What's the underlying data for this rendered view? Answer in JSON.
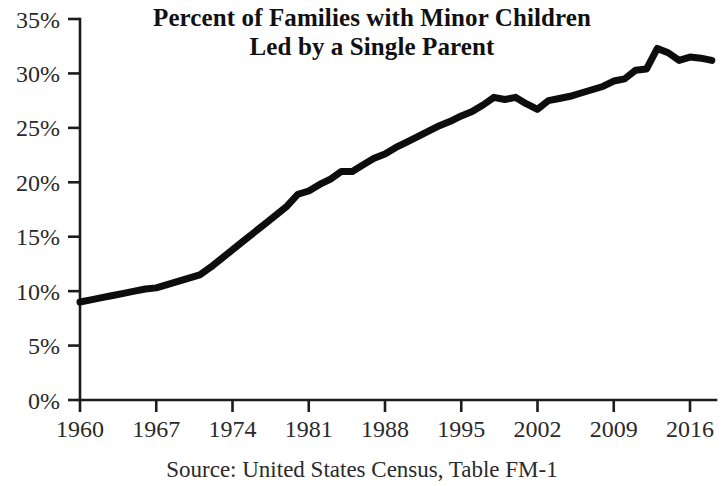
{
  "chart_data": {
    "type": "line",
    "title": "Percent of Families with Minor Children Led by a Single Parent",
    "title_lines": [
      "Percent of Families with Minor Children",
      "Led by a Single Parent"
    ],
    "source_note": "Source: United States Census, Table FM-1",
    "xlabel": "",
    "ylabel": "",
    "xlim": [
      1960,
      2018
    ],
    "ylim": [
      0,
      35
    ],
    "grid": false,
    "legend": false,
    "legend_position": "none",
    "line_color": "#0d0d0d",
    "axis_color": "#1c1c1c",
    "background_color": "#ffffff",
    "y_ticks": [
      0,
      5,
      10,
      15,
      20,
      25,
      30,
      35
    ],
    "y_tick_labels": [
      "0%",
      "5%",
      "10%",
      "15%",
      "20%",
      "25%",
      "30%",
      "35%"
    ],
    "x_ticks": [
      1960,
      1967,
      1974,
      1981,
      1988,
      1995,
      2002,
      2009,
      2016
    ],
    "x_tick_labels": [
      "1960",
      "1967",
      "1974",
      "1981",
      "1988",
      "1995",
      "2002",
      "2009",
      "2016"
    ],
    "series": [
      {
        "name": "Percent of families with minor children led by a single parent",
        "x": [
          1960,
          1961,
          1962,
          1963,
          1964,
          1965,
          1966,
          1967,
          1968,
          1969,
          1970,
          1971,
          1972,
          1973,
          1974,
          1975,
          1976,
          1977,
          1978,
          1979,
          1980,
          1981,
          1982,
          1983,
          1984,
          1985,
          1986,
          1987,
          1988,
          1989,
          1990,
          1991,
          1992,
          1993,
          1994,
          1995,
          1996,
          1997,
          1998,
          1999,
          2000,
          2001,
          2002,
          2003,
          2004,
          2005,
          2006,
          2007,
          2008,
          2009,
          2010,
          2011,
          2012,
          2013,
          2014,
          2015,
          2016,
          2017,
          2018
        ],
        "values": [
          9.0,
          9.2,
          9.4,
          9.6,
          9.8,
          10.0,
          10.2,
          10.3,
          10.6,
          10.9,
          11.2,
          11.5,
          12.2,
          13.0,
          13.8,
          14.6,
          15.4,
          16.2,
          17.0,
          17.8,
          18.9,
          19.2,
          19.8,
          20.3,
          21.0,
          21.0,
          21.6,
          22.2,
          22.6,
          23.2,
          23.7,
          24.2,
          24.7,
          25.2,
          25.6,
          26.1,
          26.5,
          27.1,
          27.8,
          27.6,
          27.8,
          27.2,
          26.7,
          27.5,
          27.7,
          27.9,
          28.2,
          28.5,
          28.8,
          29.3,
          29.5,
          30.3,
          30.4,
          32.3,
          31.9,
          31.2,
          31.5,
          31.4,
          31.2
        ]
      }
    ],
    "notable_points": {
      "start": {
        "year": 1960,
        "value": 9.0
      },
      "peak": {
        "year": 2013,
        "value": 32.3
      },
      "local_peak": {
        "year": 1998,
        "value": 27.8
      },
      "local_dip": {
        "year": 2002,
        "value": 26.7
      },
      "end": {
        "year": 2018,
        "value": 31.2
      }
    }
  }
}
